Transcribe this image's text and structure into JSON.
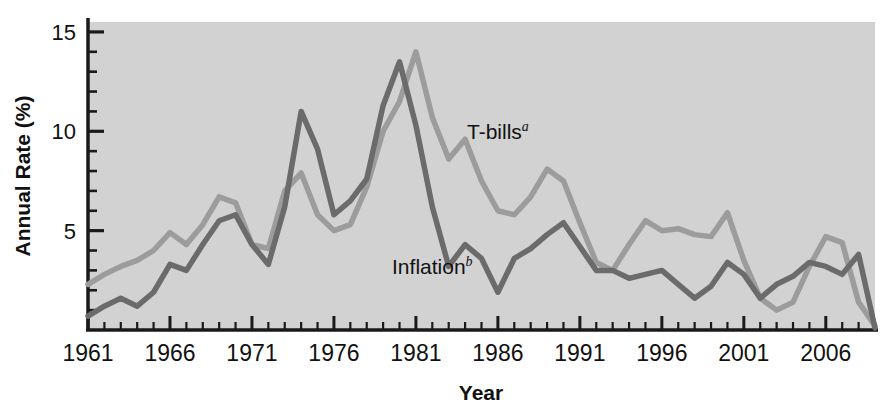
{
  "chart_data": {
    "type": "line",
    "title": "",
    "xlabel": "Year",
    "ylabel": "Annual Rate (%)",
    "xlim": [
      1961,
      2009
    ],
    "ylim": [
      0,
      15.5
    ],
    "grid": false,
    "legend_position": "inline-annotation",
    "y_ticks_major": [
      5,
      10,
      15
    ],
    "y_tick_labels": [
      "5",
      "10",
      "15"
    ],
    "y_tick_minor_step": 1,
    "x_ticks_major": [
      1961,
      1966,
      1971,
      1976,
      1981,
      1986,
      1991,
      1996,
      2001,
      2006
    ],
    "x_tick_labels": [
      "1961",
      "1966",
      "1971",
      "1976",
      "1981",
      "1986",
      "1991",
      "1996",
      "2001",
      "2006"
    ],
    "x_tick_minor_step": 1,
    "plot_background": "#d2d2d2",
    "x": [
      1961,
      1962,
      1963,
      1964,
      1965,
      1966,
      1967,
      1968,
      1969,
      1970,
      1971,
      1972,
      1973,
      1974,
      1975,
      1976,
      1977,
      1978,
      1979,
      1980,
      1981,
      1982,
      1983,
      1984,
      1985,
      1986,
      1987,
      1988,
      1989,
      1990,
      1991,
      1992,
      1993,
      1994,
      1995,
      1996,
      1997,
      1998,
      1999,
      2000,
      2001,
      2002,
      2003,
      2004,
      2005,
      2006,
      2007,
      2008,
      2009
    ],
    "series": [
      {
        "name": "T-bills",
        "superscript": "a",
        "color": "#9c9c9c",
        "label_x": 1986,
        "label_y": 9.6,
        "values": [
          2.3,
          2.8,
          3.2,
          3.5,
          4.0,
          4.9,
          4.3,
          5.3,
          6.7,
          6.4,
          4.3,
          4.1,
          7.0,
          7.9,
          5.8,
          5.0,
          5.3,
          7.2,
          10.0,
          11.5,
          14.0,
          10.7,
          8.6,
          9.6,
          7.5,
          6.0,
          5.8,
          6.7,
          8.1,
          7.5,
          5.4,
          3.4,
          3.0,
          4.3,
          5.5,
          5.0,
          5.1,
          4.8,
          4.7,
          5.9,
          3.5,
          1.6,
          1.0,
          1.4,
          3.2,
          4.7,
          4.4,
          1.4,
          0.2
        ]
      },
      {
        "name": "Inflation",
        "superscript": "b",
        "color": "#6b6b6b",
        "label_x": 1982,
        "label_y": 2.8,
        "values": [
          0.7,
          1.2,
          1.6,
          1.2,
          1.9,
          3.3,
          3.0,
          4.3,
          5.5,
          5.8,
          4.3,
          3.3,
          6.2,
          11.0,
          9.1,
          5.8,
          6.5,
          7.6,
          11.3,
          13.5,
          10.3,
          6.2,
          3.2,
          4.3,
          3.6,
          1.9,
          3.6,
          4.1,
          4.8,
          5.4,
          4.2,
          3.0,
          3.0,
          2.6,
          2.8,
          3.0,
          2.3,
          1.6,
          2.2,
          3.4,
          2.8,
          1.6,
          2.3,
          2.7,
          3.4,
          3.2,
          2.8,
          3.8,
          0.1
        ]
      }
    ]
  },
  "axes": {
    "y_axis_title": "Annual Rate (%)",
    "x_axis_title": "Year"
  }
}
